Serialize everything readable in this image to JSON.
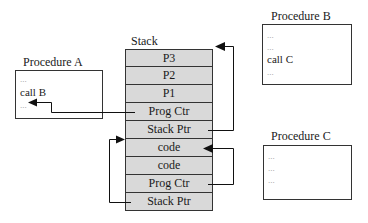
{
  "stack": {
    "title": "Stack",
    "cells": [
      "P3",
      "P2",
      "P1",
      "Prog Ctr",
      "Stack Ptr",
      "code",
      "code",
      "Prog Ctr",
      "Stack Ptr"
    ],
    "fill_color": "#d9d9d9"
  },
  "procedures": [
    {
      "title": "Procedure A",
      "lines": [
        "...",
        "call B",
        "..."
      ]
    },
    {
      "title": "Procedure B",
      "lines": [
        "...",
        "...",
        "call C",
        "..."
      ]
    },
    {
      "title": "Procedure C",
      "lines": [
        "...",
        "...",
        "..."
      ]
    }
  ],
  "arrows": [
    {
      "from": "stack.cells.3 (Prog Ctr)",
      "to": "Procedure A line after call B"
    },
    {
      "from": "stack.cells.4 (Stack Ptr)",
      "to": "stack top (P3)"
    },
    {
      "from": "stack.cells.7 (Prog Ctr)",
      "to": "stack.cells.5 (code)"
    },
    {
      "from": "stack.cells.8 (Stack Ptr)",
      "to": "stack.cells.5 (code) left edge"
    }
  ]
}
